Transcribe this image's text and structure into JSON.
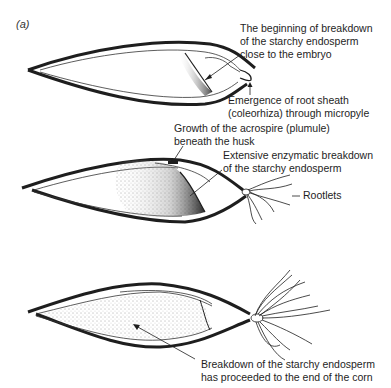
{
  "panel_label": "(a)",
  "stages": [
    {
      "name": "stage-1",
      "labels": {
        "breakdown_start": [
          "The beginning of breakdown",
          "of the starchy endosperm",
          "close to the embryo"
        ],
        "root_sheath": [
          "Emergence of root sheath",
          "(coleorhiza) through micropyle"
        ]
      }
    },
    {
      "name": "stage-2",
      "labels": {
        "acrospire": [
          "Growth of the acrospire (plumule)",
          "beneath the husk"
        ],
        "enzymatic": [
          "Extensive enzymatic breakdown",
          "of the starchy endosperm"
        ],
        "rootlets": "Rootlets"
      }
    },
    {
      "name": "stage-3",
      "labels": {
        "complete": [
          "Breakdown of the starchy endosperm",
          "has proceeded to the end of the corn"
        ]
      }
    }
  ],
  "colors": {
    "ink": "#1e1e1e",
    "background": "#ffffff"
  }
}
